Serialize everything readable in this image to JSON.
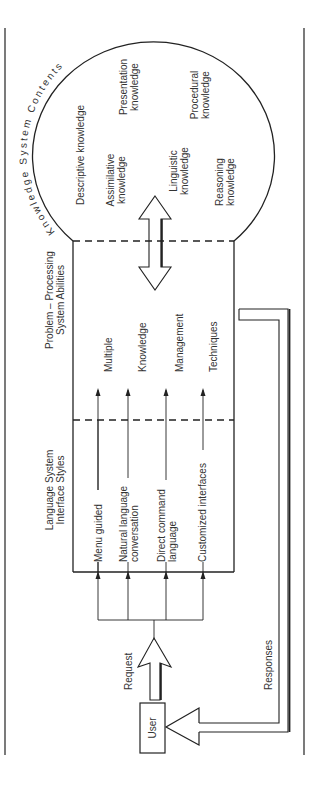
{
  "diagram": {
    "orientation": "rotated-90-ccw",
    "knowledge_section": {
      "title": "Knowledge System Contents",
      "items": [
        {
          "label_lines": [
            "Descriptive knowledge"
          ]
        },
        {
          "label_lines": [
            "Assimilative",
            "knowledge"
          ]
        },
        {
          "label_lines": [
            "Presentation",
            "knowledge"
          ]
        },
        {
          "label_lines": [
            "Linguistic",
            "knowledge"
          ]
        },
        {
          "label_lines": [
            "Procedural",
            "knowledge"
          ]
        },
        {
          "label_lines": [
            "Reasoning",
            "knowledge"
          ]
        }
      ]
    },
    "problem_section": {
      "title_lines": [
        "Problem – Processing",
        "System Abilities"
      ],
      "items": [
        "Multiple",
        "Knowledge",
        "Management",
        "Techniques"
      ]
    },
    "language_section": {
      "title_lines": [
        "Language System",
        "Interface Styles"
      ],
      "items": [
        {
          "label_lines": [
            "Menu guided"
          ]
        },
        {
          "label_lines": [
            "Natural language",
            "conversation"
          ]
        },
        {
          "label_lines": [
            "Direct command",
            "language"
          ]
        },
        {
          "label_lines": [
            "Customized interfaces"
          ]
        }
      ]
    },
    "user": {
      "label": "User"
    },
    "request_label": "Request",
    "responses_label": "Responses",
    "colors": {
      "line": "#222222",
      "text": "#333333",
      "background": "#ffffff"
    }
  }
}
